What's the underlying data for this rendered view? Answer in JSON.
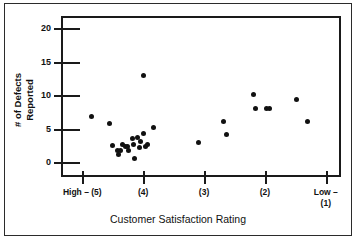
{
  "figure": {
    "background_color": "#ffffff",
    "frame_color": "#2b2b2b",
    "marker_color": "#111111"
  },
  "axes": {
    "x_title": "Customer Satisfaction Rating",
    "y_title_line1": "# of Defects",
    "y_title_line2": "Reported",
    "y_ticks": [
      {
        "value": 0,
        "label": "0"
      },
      {
        "value": 5,
        "label": "5"
      },
      {
        "value": 10,
        "label": "10"
      },
      {
        "value": 15,
        "label": "15"
      },
      {
        "value": 20,
        "label": "20"
      }
    ],
    "x_ticks": [
      {
        "position": 5,
        "label_line1": "High – (5)",
        "label_line2": ""
      },
      {
        "position": 4,
        "label_line1": "(4)",
        "label_line2": ""
      },
      {
        "position": 3,
        "label_line1": "(3)",
        "label_line2": ""
      },
      {
        "position": 2,
        "label_line1": "(2)",
        "label_line2": ""
      },
      {
        "position": 1,
        "label_line1": "Low –",
        "label_line2": "(1)"
      }
    ]
  },
  "chart_data": {
    "type": "scatter",
    "title": "",
    "xlabel": "Customer Satisfaction Rating",
    "ylabel": "# of Defects Reported",
    "xlim": [
      5.35,
      0.75
    ],
    "ylim": [
      -2.5,
      21.5
    ],
    "grid": false,
    "legend": null,
    "x_tick_labels": [
      "High – (5)",
      "(4)",
      "(3)",
      "(2)",
      "Low – (1)"
    ],
    "x_tick_values": [
      5,
      4,
      3,
      2,
      1
    ],
    "y_tick_values": [
      0,
      5,
      10,
      15,
      20
    ],
    "series": [
      {
        "name": "Defects vs Satisfaction",
        "marker": "filled-circle",
        "color": "#111111",
        "points": [
          {
            "x": 4.88,
            "y": 6.8
          },
          {
            "x": 4.58,
            "y": 5.8
          },
          {
            "x": 4.53,
            "y": 2.5
          },
          {
            "x": 4.46,
            "y": 1.7
          },
          {
            "x": 4.44,
            "y": 1.2
          },
          {
            "x": 4.41,
            "y": 1.7
          },
          {
            "x": 4.38,
            "y": 2.6
          },
          {
            "x": 4.33,
            "y": 2.3
          },
          {
            "x": 4.29,
            "y": 2.4
          },
          {
            "x": 4.27,
            "y": 1.8
          },
          {
            "x": 4.21,
            "y": 3.6
          },
          {
            "x": 4.19,
            "y": 2.6
          },
          {
            "x": 4.17,
            "y": 0.5
          },
          {
            "x": 4.13,
            "y": 3.7
          },
          {
            "x": 4.1,
            "y": 2.2
          },
          {
            "x": 4.07,
            "y": 3.1
          },
          {
            "x": 4.03,
            "y": 12.9
          },
          {
            "x": 4.02,
            "y": 4.3
          },
          {
            "x": 3.99,
            "y": 2.3
          },
          {
            "x": 3.96,
            "y": 2.6
          },
          {
            "x": 3.87,
            "y": 5.2
          },
          {
            "x": 3.12,
            "y": 2.9
          },
          {
            "x": 2.72,
            "y": 6.1
          },
          {
            "x": 2.66,
            "y": 4.1
          },
          {
            "x": 2.22,
            "y": 10.1
          },
          {
            "x": 2.19,
            "y": 8.0
          },
          {
            "x": 2.0,
            "y": 8.0
          },
          {
            "x": 1.95,
            "y": 8.0
          },
          {
            "x": 1.52,
            "y": 9.4
          },
          {
            "x": 1.33,
            "y": 6.1
          }
        ]
      }
    ]
  }
}
